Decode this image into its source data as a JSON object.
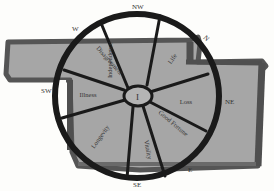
{
  "diagram": {
    "type": "bagua-wheel-floorplan",
    "colors": {
      "background": "#fdfdfb",
      "floor_fill": "#a9a9a9",
      "floor_border": "#5e5e5e",
      "wheel_stroke": "#1a1a1a",
      "label_text": "#333333"
    },
    "directions": {
      "nw": "NW",
      "w": "W",
      "sw": "SW",
      "n": "N",
      "ne": "NE",
      "e": "E",
      "se": "SE"
    },
    "sectors": {
      "s1": "Independence",
      "s2": "Life",
      "s3": "Loss",
      "s4": "Good Fortune",
      "s5": "Vitality",
      "s6": "Longevity",
      "s7": "Illness",
      "s8": "Disagreement"
    },
    "hub_label": "I"
  }
}
